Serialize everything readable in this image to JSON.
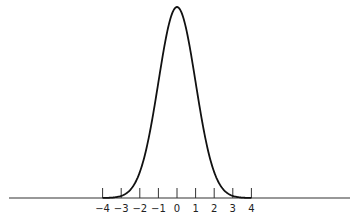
{
  "chart_data": {
    "type": "line",
    "title": "",
    "xlabel": "",
    "ylabel": "",
    "x_ticks": [
      -4,
      -3,
      -2,
      -1,
      0,
      1,
      2,
      3,
      4
    ],
    "tick_labels": [
      "−4",
      "−3",
      "−2",
      "−1",
      "0",
      "1",
      "2",
      "3",
      "4"
    ],
    "xlim": [
      -4,
      4
    ],
    "ylim": [
      0,
      1
    ],
    "grid": false,
    "series": [
      {
        "name": "density",
        "x": [
          -4,
          -3.5,
          -3,
          -2.5,
          -2,
          -1.5,
          -1,
          -0.5,
          0,
          0.5,
          1,
          1.5,
          2,
          2.5,
          3,
          3.5,
          4
        ],
        "values": [
          0.0003,
          0.0022,
          0.0111,
          0.0439,
          0.1353,
          0.3247,
          0.6065,
          0.8825,
          1.0,
          0.8825,
          0.6065,
          0.3247,
          0.1353,
          0.0439,
          0.0111,
          0.0022,
          0.0003
        ]
      }
    ],
    "colors": {
      "curve": "#111111",
      "axis": "#333333"
    }
  }
}
